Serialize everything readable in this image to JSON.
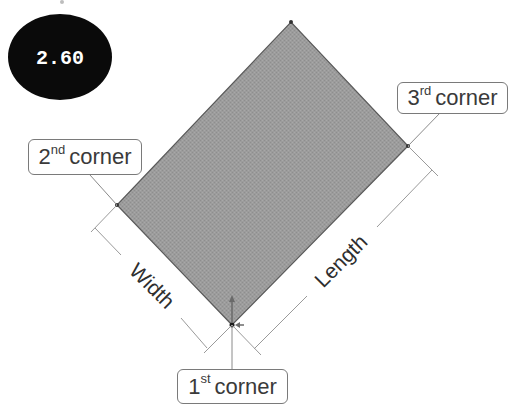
{
  "badge": {
    "text": "2.60",
    "background": "#0a0a0a",
    "color": "#ffffff"
  },
  "rectangle": {
    "fill": "#9c9c9c",
    "stroke": "#5a5a5a",
    "corners": {
      "first": [
        232,
        325
      ],
      "second": [
        117,
        205
      ],
      "top": [
        291,
        22
      ],
      "third": [
        408,
        146
      ]
    }
  },
  "callouts": {
    "first": {
      "number": "1",
      "suffix": "st",
      "word": "corner"
    },
    "second": {
      "number": "2",
      "suffix": "nd",
      "word": "corner"
    },
    "third": {
      "number": "3",
      "suffix": "rd",
      "word": "corner"
    }
  },
  "dimensions": {
    "width_label": "Width",
    "length_label": "Length"
  },
  "colors": {
    "dimension_line": "#9a9a9a",
    "leader_line": "#8a8a8a",
    "arrow": "#7a7a7a"
  }
}
